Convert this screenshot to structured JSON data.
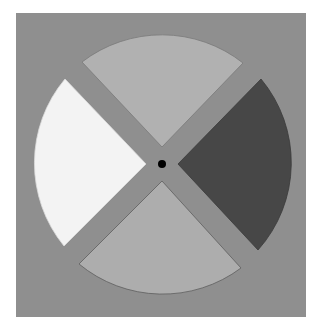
{
  "canvas": {
    "width": 318,
    "height": 329,
    "page_bg": "#ffffff"
  },
  "background_square": {
    "x": 16,
    "y": 13,
    "width": 290,
    "height": 304,
    "color": "#8f8f8f"
  },
  "center": {
    "x": 162,
    "y": 164
  },
  "fixation_dot": {
    "radius": 4,
    "color": "#000000"
  },
  "sectors": [
    {
      "name": "top",
      "color": "#b1b1b1",
      "stroke": "#7a7a7a",
      "tip": [
        162,
        147
      ],
      "corner_a": [
        82,
        62
      ],
      "arc_mid": [
        162,
        31
      ],
      "corner_b": [
        243,
        63
      ],
      "radius": 131
    },
    {
      "name": "right",
      "color": "#474747",
      "stroke": "#3a3a3a",
      "tip": [
        178,
        164
      ],
      "corner_a": [
        261,
        79
      ],
      "arc_mid": [
        291,
        164
      ],
      "corner_b": [
        258,
        250
      ],
      "radius": 131
    },
    {
      "name": "bottom",
      "color": "#adadad",
      "stroke": "#5e5e5e",
      "tip": [
        162,
        181
      ],
      "corner_a": [
        241,
        268
      ],
      "arc_mid": [
        162,
        296
      ],
      "corner_b": [
        79,
        264
      ],
      "radius": 131
    },
    {
      "name": "left",
      "color": "#f3f3f3",
      "stroke": "#dcdcdc",
      "tip": [
        146,
        164
      ],
      "corner_a": [
        64,
        246
      ],
      "arc_mid": [
        35,
        164
      ],
      "corner_b": [
        65,
        79
      ],
      "radius": 131
    }
  ]
}
